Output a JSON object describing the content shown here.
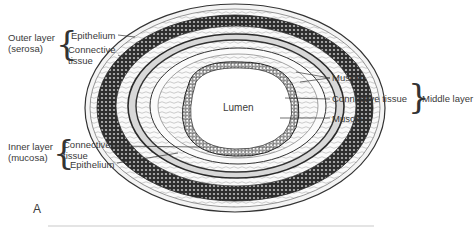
{
  "figure": {
    "panel_letter": "A",
    "center_label": "Lumen",
    "outer_layer": {
      "name_line1": "Outer layer",
      "name_line2": "(serosa)",
      "components": [
        "Epithelium",
        "Connective",
        "tissue"
      ]
    },
    "inner_layer": {
      "name_line1": "Inner layer",
      "name_line2": "(mucosa)",
      "components": [
        "Connective",
        "tissue",
        "Epithelium"
      ]
    },
    "middle_layer": {
      "name": "Middle layer",
      "components": [
        "Muscle",
        "Connective tissue",
        "Muscle"
      ]
    }
  },
  "colors": {
    "ink": "#2b2b2b",
    "background": "#ffffff",
    "muscle_band": "#3a3a3a"
  }
}
